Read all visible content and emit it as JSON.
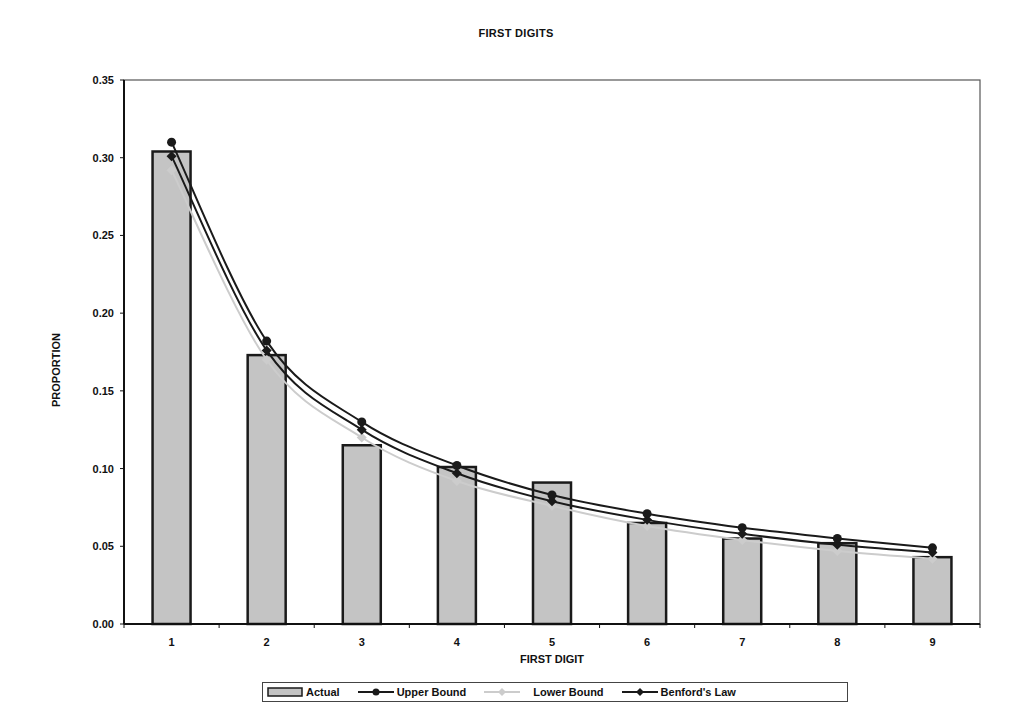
{
  "chart_data": {
    "type": "bar",
    "title": "FIRST DIGITS",
    "xlabel": "FIRST DIGIT",
    "ylabel": "PROPORTION",
    "categories": [
      "1",
      "2",
      "3",
      "4",
      "5",
      "6",
      "7",
      "8",
      "9"
    ],
    "ylim": [
      0,
      0.35
    ],
    "yticks": [
      "0.00",
      "0.05",
      "0.10",
      "0.15",
      "0.20",
      "0.25",
      "0.30",
      "0.35"
    ],
    "grid": false,
    "legend_position": "bottom",
    "series": [
      {
        "name": "Actual",
        "kind": "bar",
        "values": [
          0.304,
          0.173,
          0.115,
          0.101,
          0.091,
          0.065,
          0.055,
          0.052,
          0.043
        ]
      },
      {
        "name": "Upper Bound",
        "kind": "line",
        "marker": "circle",
        "values": [
          0.31,
          0.182,
          0.13,
          0.102,
          0.083,
          0.071,
          0.062,
          0.055,
          0.049
        ]
      },
      {
        "name": "Lower Bound",
        "kind": "line",
        "marker": "diamond",
        "color": "#c8c8c8",
        "values": [
          0.292,
          0.17,
          0.12,
          0.092,
          0.076,
          0.063,
          0.054,
          0.047,
          0.042
        ]
      },
      {
        "name": "Benford's Law",
        "kind": "line",
        "marker": "diamond",
        "values": [
          0.301,
          0.176,
          0.125,
          0.097,
          0.079,
          0.067,
          0.058,
          0.051,
          0.046
        ]
      }
    ]
  },
  "legend": {
    "actual": "Actual",
    "upper": "Upper Bound",
    "lower": "Lower Bound",
    "benford": "Benford's Law"
  },
  "colors": {
    "bar_fill": "#c4c4c4",
    "bar_edge": "#1a1a1a",
    "upper": "#1a1a1a",
    "lower": "#cccccc",
    "benford": "#1a1a1a"
  }
}
